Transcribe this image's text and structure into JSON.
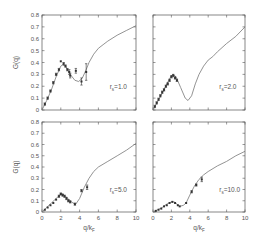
{
  "figure": {
    "ylabel": "G(q)",
    "xlabel": "q/kF"
  },
  "chart_data": [
    {
      "type": "line",
      "panel": "top-left",
      "label": "rs=1.0",
      "xlabel": "",
      "ylabel": "G(q)",
      "xlim": [
        0,
        10
      ],
      "ylim": [
        0,
        0.8
      ],
      "xticks": [
        0,
        2,
        4,
        6,
        8,
        10
      ],
      "yticks": [
        0,
        0.1,
        0.2,
        0.3,
        0.4,
        0.5,
        0.6,
        0.7,
        0.8
      ],
      "show_xtick_labels": false,
      "show_ytick_labels": true,
      "curve": {
        "x": [
          0,
          0.5,
          1,
          1.5,
          2,
          2.2,
          2.5,
          3,
          3.5,
          3.9,
          4.3,
          4.7,
          5,
          5.5,
          6,
          6.5,
          7,
          8,
          9,
          10
        ],
        "y": [
          0,
          0.08,
          0.17,
          0.28,
          0.37,
          0.38,
          0.37,
          0.3,
          0.25,
          0.24,
          0.27,
          0.34,
          0.4,
          0.47,
          0.52,
          0.55,
          0.58,
          0.63,
          0.67,
          0.71
        ]
      },
      "points": {
        "x": [
          0.3,
          0.6,
          0.9,
          1.2,
          1.5,
          1.8,
          2.0,
          2.3,
          2.5,
          2.7,
          2.9,
          3.0,
          3.6,
          4.2,
          4.7
        ],
        "y": [
          0.05,
          0.1,
          0.16,
          0.23,
          0.3,
          0.34,
          0.41,
          0.39,
          0.37,
          0.34,
          0.32,
          0.29,
          0.33,
          0.24,
          0.32
        ],
        "err": [
          0.01,
          0.01,
          0.01,
          0.01,
          0.01,
          0.01,
          0.005,
          0.01,
          0.01,
          0.01,
          0.02,
          0.02,
          0.02,
          0.03,
          0.07
        ]
      }
    },
    {
      "type": "line",
      "panel": "top-right",
      "label": "rs=2.0",
      "xlabel": "",
      "ylabel": "",
      "xlim": [
        0,
        10
      ],
      "ylim": [
        0,
        0.8
      ],
      "xticks": [
        0,
        2,
        4,
        6,
        8,
        10
      ],
      "yticks": [
        0,
        0.1,
        0.2,
        0.3,
        0.4,
        0.5,
        0.6,
        0.7,
        0.8
      ],
      "show_xtick_labels": false,
      "show_ytick_labels": false,
      "curve": {
        "x": [
          0,
          0.5,
          1,
          1.5,
          2,
          2.2,
          2.5,
          3,
          3.5,
          3.8,
          4.2,
          4.6,
          5,
          5.5,
          6,
          6.5,
          7,
          8,
          9,
          10
        ],
        "y": [
          0,
          0.07,
          0.14,
          0.22,
          0.29,
          0.3,
          0.28,
          0.19,
          0.1,
          0.08,
          0.12,
          0.22,
          0.3,
          0.37,
          0.42,
          0.45,
          0.49,
          0.56,
          0.62,
          0.7
        ]
      },
      "points": {
        "x": [
          0.2,
          0.4,
          0.6,
          0.8,
          1.0,
          1.2,
          1.4,
          1.6,
          1.8,
          2.0,
          2.2,
          2.4,
          2.6
        ],
        "y": [
          0.03,
          0.06,
          0.09,
          0.12,
          0.15,
          0.17,
          0.2,
          0.22,
          0.25,
          0.28,
          0.29,
          0.27,
          0.25
        ],
        "err": [
          0.01,
          0.01,
          0.01,
          0.01,
          0.01,
          0.01,
          0.01,
          0.01,
          0.01,
          0.01,
          0.01,
          0.01,
          0.01
        ]
      }
    },
    {
      "type": "line",
      "panel": "bottom-left",
      "label": "rs=5.0",
      "xlabel": "q/kF",
      "ylabel": "G(q)",
      "xlim": [
        0,
        10
      ],
      "ylim": [
        0,
        0.8
      ],
      "xticks": [
        0,
        2,
        4,
        6,
        8,
        10
      ],
      "yticks": [
        0,
        0.1,
        0.2,
        0.3,
        0.4,
        0.5,
        0.6,
        0.7,
        0.8
      ],
      "show_xtick_labels": true,
      "show_ytick_labels": true,
      "curve": {
        "x": [
          0,
          0.5,
          1,
          1.5,
          2,
          2.2,
          2.5,
          3,
          3.3,
          3.6,
          4,
          4.5,
          5,
          5.5,
          6,
          7,
          8,
          9,
          10
        ],
        "y": [
          0,
          0.04,
          0.08,
          0.12,
          0.16,
          0.16,
          0.14,
          0.1,
          0.08,
          0.07,
          0.12,
          0.22,
          0.3,
          0.36,
          0.4,
          0.45,
          0.5,
          0.55,
          0.61
        ]
      },
      "points": {
        "x": [
          0.3,
          0.6,
          0.9,
          1.2,
          1.5,
          1.8,
          2.0,
          2.2,
          2.4,
          2.6,
          2.8,
          3.0,
          3.5,
          4.2,
          4.8
        ],
        "y": [
          0.02,
          0.04,
          0.06,
          0.08,
          0.11,
          0.14,
          0.16,
          0.15,
          0.14,
          0.12,
          0.1,
          0.09,
          0.07,
          0.19,
          0.22
        ],
        "err": [
          0.005,
          0.005,
          0.005,
          0.005,
          0.005,
          0.01,
          0.01,
          0.01,
          0.01,
          0.01,
          0.01,
          0.01,
          0.01,
          0.01,
          0.02
        ]
      }
    },
    {
      "type": "line",
      "panel": "bottom-right",
      "label": "rs=10.0",
      "xlabel": "q/kF",
      "ylabel": "",
      "xlim": [
        0,
        10
      ],
      "ylim": [
        0,
        0.8
      ],
      "xticks": [
        0,
        2,
        4,
        6,
        8,
        10
      ],
      "yticks": [
        0,
        0.1,
        0.2,
        0.3,
        0.4,
        0.5,
        0.6,
        0.7,
        0.8
      ],
      "show_xtick_labels": true,
      "show_ytick_labels": false,
      "curve": {
        "x": [
          0,
          0.5,
          1,
          1.5,
          2,
          2.3,
          2.6,
          2.9,
          3.3,
          3.6,
          4,
          4.5,
          5,
          5.5,
          6,
          7,
          8,
          9,
          10
        ],
        "y": [
          0,
          0.02,
          0.04,
          0.07,
          0.09,
          0.09,
          0.07,
          0.05,
          0.06,
          0.08,
          0.15,
          0.23,
          0.29,
          0.33,
          0.36,
          0.41,
          0.45,
          0.5,
          0.54
        ]
      },
      "points": {
        "x": [
          0.3,
          0.6,
          0.9,
          1.2,
          1.5,
          1.8,
          2.1,
          2.4,
          2.7,
          2.9,
          3.6,
          4.2,
          4.7,
          5.3
        ],
        "y": [
          0.01,
          0.02,
          0.03,
          0.05,
          0.06,
          0.08,
          0.09,
          0.08,
          0.06,
          0.05,
          0.08,
          0.18,
          0.24,
          0.29
        ],
        "err": [
          0.005,
          0.005,
          0.005,
          0.005,
          0.005,
          0.005,
          0.005,
          0.005,
          0.005,
          0.005,
          0.005,
          0.01,
          0.01,
          0.02
        ]
      }
    }
  ],
  "panels_layout": [
    {
      "x0": 42,
      "y0": 15,
      "x1": 136,
      "y1": 110
    },
    {
      "x0": 153,
      "y0": 15,
      "x1": 245,
      "y1": 110
    },
    {
      "x0": 42,
      "y0": 122,
      "x1": 136,
      "y1": 212
    },
    {
      "x0": 153,
      "y0": 122,
      "x1": 245,
      "y1": 212
    }
  ],
  "colors": {
    "axis": "#555555",
    "curve": "#777777",
    "points": "#333333"
  }
}
